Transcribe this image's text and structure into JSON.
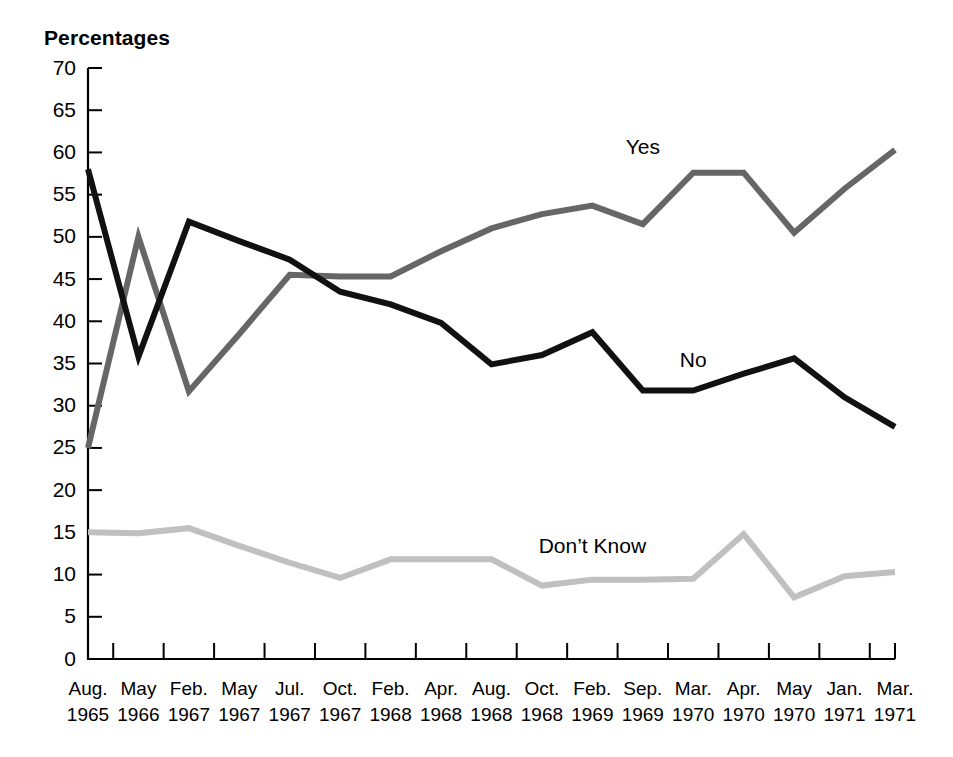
{
  "chart_data": {
    "type": "line",
    "title": "",
    "ylabel": "Percentages",
    "xlabel": "",
    "ylim": [
      0,
      70
    ],
    "ytick_step": 5,
    "yticks": [
      0,
      5,
      10,
      15,
      20,
      25,
      30,
      35,
      40,
      45,
      50,
      55,
      60,
      65,
      70
    ],
    "grid": false,
    "legend_position": "inline-annotations",
    "categories": [
      "Aug. 1965",
      "May 1966",
      "Feb. 1967",
      "May 1967",
      "Jul. 1967",
      "Oct. 1967",
      "Feb. 1968",
      "Apr. 1968",
      "Aug. 1968",
      "Oct. 1968",
      "Feb. 1969",
      "Sep. 1969",
      "Mar. 1970",
      "Apr. 1970",
      "May 1970",
      "Jan. 1971",
      "Mar. 1971"
    ],
    "category_months": [
      "Aug.",
      "May",
      "Feb.",
      "May",
      "Jul.",
      "Oct.",
      "Feb.",
      "Apr.",
      "Aug.",
      "Oct.",
      "Feb.",
      "Sep.",
      "Mar.",
      "Apr.",
      "May",
      "Jan.",
      "Mar."
    ],
    "category_years": [
      "1965",
      "1966",
      "1967",
      "1967",
      "1967",
      "1967",
      "1968",
      "1968",
      "1968",
      "1968",
      "1969",
      "1969",
      "1970",
      "1970",
      "1970",
      "1971",
      "1971"
    ],
    "series": [
      {
        "name": "Yes",
        "color": "#666666",
        "stroke_width": 6,
        "label": "Yes",
        "values": [
          25.0,
          50.0,
          31.7,
          38.5,
          45.5,
          45.3,
          45.3,
          48.3,
          51.0,
          52.7,
          53.7,
          51.5,
          57.6,
          57.6,
          50.5,
          55.7,
          60.3
        ]
      },
      {
        "name": "No",
        "color": "#111111",
        "stroke_width": 6,
        "label": "No",
        "values": [
          58.0,
          35.8,
          51.8,
          49.5,
          47.3,
          43.5,
          42.0,
          39.8,
          34.9,
          36.0,
          38.7,
          31.8,
          31.8,
          33.8,
          35.6,
          31.0,
          27.5
        ]
      },
      {
        "name": "Don't Know",
        "color": "#c0c0c0",
        "stroke_width": 6,
        "label": "Don’t Know",
        "values": [
          15.0,
          14.9,
          15.5,
          13.4,
          11.4,
          9.6,
          11.8,
          11.8,
          11.8,
          8.7,
          9.4,
          9.4,
          9.5,
          14.8,
          7.3,
          9.8,
          10.3
        ]
      }
    ],
    "annotations": [
      {
        "text": "Yes",
        "category_index": 11,
        "value": 59.8
      },
      {
        "text": "No",
        "category_index": 12,
        "value": 34.6
      },
      {
        "text": "Don’t Know",
        "category_index": 10,
        "value": 12.6
      }
    ]
  }
}
